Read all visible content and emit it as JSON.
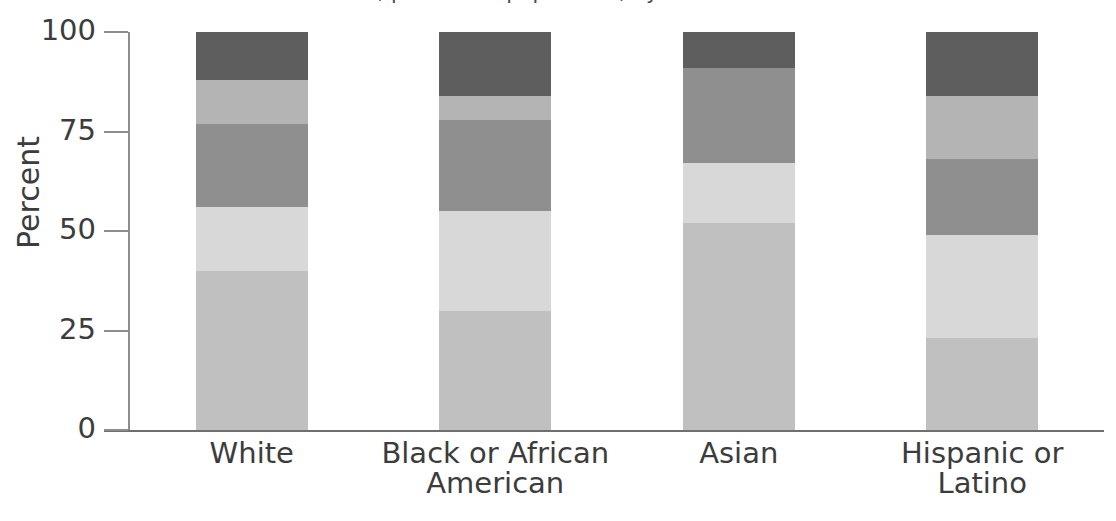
{
  "chart_data": {
    "type": "bar",
    "subtype": "stacked-100-percent",
    "title": "Education attainment, percent of population, by race",
    "title_partially_cut_off": true,
    "ylabel": "Percent",
    "xlabel": "",
    "ylim": [
      0,
      100
    ],
    "yticks": [
      0,
      25,
      50,
      75,
      100
    ],
    "ytick_labels": [
      "0",
      "25",
      "50",
      "75",
      "100"
    ],
    "grid": false,
    "legend_position": "none",
    "categories": [
      "White",
      "Black or African American",
      "Asian",
      "Hispanic or Latino"
    ],
    "category_lines": [
      [
        "White"
      ],
      [
        "Black or African",
        "American"
      ],
      [
        "Asian"
      ],
      [
        "Hispanic or",
        "Latino"
      ]
    ],
    "series": [
      {
        "name": "Segment 1",
        "order": 1,
        "color": "#c0c0c0",
        "values": [
          40,
          30,
          52,
          23
        ]
      },
      {
        "name": "Segment 2",
        "order": 2,
        "color": "#d8d8d8",
        "values": [
          16,
          25,
          15,
          26
        ]
      },
      {
        "name": "Segment 3",
        "order": 3,
        "color": "#8f8f8f",
        "values": [
          21,
          23,
          24,
          19
        ]
      },
      {
        "name": "Segment 4",
        "order": 4,
        "color": "#b4b4b4",
        "values": [
          11,
          6,
          0,
          16
        ]
      },
      {
        "name": "Segment 5",
        "order": 5,
        "color": "#5e5e5e",
        "values": [
          12,
          16,
          9,
          16
        ]
      }
    ]
  },
  "axis": {
    "y_label": "Percent"
  },
  "colors": {
    "axis": "#8d8d8d",
    "text": "#3c3c3c",
    "background": "#ffffff",
    "seg1": "#c0c0c0",
    "seg2": "#d8d8d8",
    "seg3": "#8f8f8f",
    "seg4": "#b4b4b4",
    "seg5": "#5e5e5e"
  }
}
